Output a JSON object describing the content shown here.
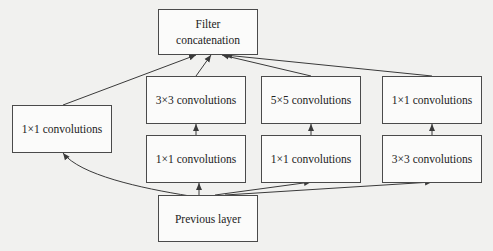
{
  "diagram": {
    "nodes": {
      "concat": {
        "line1": "Filter",
        "line2": "concatenation"
      },
      "left_1x1": {
        "label": "1×1 convolutions"
      },
      "col2_top": {
        "label": "3×3 convolutions"
      },
      "col2_bottom": {
        "label": "1×1 convolutions"
      },
      "col3_top": {
        "label": "5×5 convolutions"
      },
      "col3_bottom": {
        "label": "1×1 convolutions"
      },
      "col4_top": {
        "label": "1×1 convolutions"
      },
      "col4_bottom": {
        "label": "3×3 convolutions"
      },
      "previous": {
        "label": "Previous layer"
      }
    },
    "edges": [
      {
        "from": "previous",
        "to": "left_1x1"
      },
      {
        "from": "previous",
        "to": "col2_bottom"
      },
      {
        "from": "previous",
        "to": "col3_bottom"
      },
      {
        "from": "previous",
        "to": "col4_bottom"
      },
      {
        "from": "col2_bottom",
        "to": "col2_top"
      },
      {
        "from": "col3_bottom",
        "to": "col3_top"
      },
      {
        "from": "col4_bottom",
        "to": "col4_top"
      },
      {
        "from": "left_1x1",
        "to": "concat"
      },
      {
        "from": "col2_top",
        "to": "concat"
      },
      {
        "from": "col3_top",
        "to": "concat"
      },
      {
        "from": "col4_top",
        "to": "concat"
      }
    ],
    "colors": {
      "line": "#3a3a3a",
      "box_border": "#4a4a4a",
      "background": "#f1f1ef"
    }
  }
}
